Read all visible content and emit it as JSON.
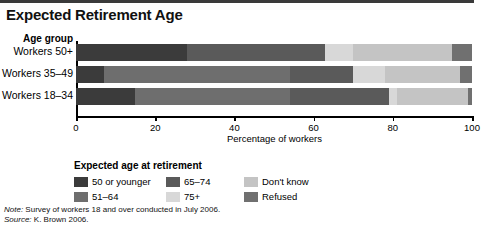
{
  "title": "Expected Retirement Age",
  "axis": {
    "category_axis_title": "Age group",
    "x_title": "Percentage of workers",
    "ticks": [
      0,
      20,
      40,
      60,
      80,
      100
    ]
  },
  "legend": {
    "title": "Expected age at retirement",
    "items": [
      {
        "label": "50 or younger",
        "color": "#3b3b3b"
      },
      {
        "label": "51–64",
        "color": "#6e6e6e"
      },
      {
        "label": "65–74",
        "color": "#5a5a5a"
      },
      {
        "label": "75+",
        "color": "#d8d8d8"
      },
      {
        "label": "Don't know",
        "color": "#c4c4c4"
      },
      {
        "label": "Refused",
        "color": "#707070"
      }
    ]
  },
  "notes": {
    "note_label": "Note:",
    "note_text": " Survey of workers 18 and over conducted in July 2006.",
    "source_label": "Source:",
    "source_text": " K. Brown 2006."
  },
  "chart_data": {
    "type": "bar",
    "orientation": "horizontal",
    "stacked": true,
    "stack_total": 100,
    "title": "Expected Retirement Age",
    "xlabel": "Percentage of workers",
    "ylabel": "Age group",
    "xlim": [
      0,
      100
    ],
    "xticks": [
      0,
      20,
      40,
      60,
      80,
      100
    ],
    "grid": false,
    "legend_position": "bottom-left",
    "categories": [
      "Workers 50+",
      "Workers 35–49",
      "Workers 18–34"
    ],
    "series": [
      {
        "name": "50 or younger",
        "color": "#3b3b3b",
        "values": [
          28,
          7,
          15
        ]
      },
      {
        "name": "51–64",
        "color": "#6e6e6e",
        "values": [
          0,
          47,
          39
        ]
      },
      {
        "name": "65–74",
        "color": "#5a5a5a",
        "values": [
          35,
          16,
          25
        ]
      },
      {
        "name": "75+",
        "color": "#d8d8d8",
        "values": [
          7,
          8,
          2
        ]
      },
      {
        "name": "Don't know",
        "color": "#c4c4c4",
        "values": [
          25,
          19,
          18
        ]
      },
      {
        "name": "Refused",
        "color": "#707070",
        "values": [
          5,
          3,
          1
        ]
      }
    ],
    "bars": [
      {
        "category": "Workers 50+",
        "segments": [
          {
            "name": "50 or younger",
            "value": 28,
            "color": "#3b3b3b"
          },
          {
            "name": "65–74",
            "value": 35,
            "color": "#5a5a5a"
          },
          {
            "name": "75+",
            "value": 7,
            "color": "#d8d8d8"
          },
          {
            "name": "Don't know",
            "value": 25,
            "color": "#c4c4c4"
          },
          {
            "name": "Refused",
            "value": 5,
            "color": "#707070"
          }
        ]
      },
      {
        "category": "Workers 35–49",
        "segments": [
          {
            "name": "50 or younger",
            "value": 7,
            "color": "#3b3b3b"
          },
          {
            "name": "51–64",
            "value": 47,
            "color": "#6e6e6e"
          },
          {
            "name": "65–74",
            "value": 16,
            "color": "#5a5a5a"
          },
          {
            "name": "75+",
            "value": 8,
            "color": "#d8d8d8"
          },
          {
            "name": "Don't know",
            "value": 19,
            "color": "#c4c4c4"
          },
          {
            "name": "Refused",
            "value": 3,
            "color": "#707070"
          }
        ]
      },
      {
        "category": "Workers 18–34",
        "segments": [
          {
            "name": "50 or younger",
            "value": 15,
            "color": "#3b3b3b"
          },
          {
            "name": "51–64",
            "value": 39,
            "color": "#6e6e6e"
          },
          {
            "name": "65–74",
            "value": 25,
            "color": "#5a5a5a"
          },
          {
            "name": "75+",
            "value": 2,
            "color": "#d8d8d8"
          },
          {
            "name": "Don't know",
            "value": 18,
            "color": "#c4c4c4"
          },
          {
            "name": "Refused",
            "value": 1,
            "color": "#707070"
          }
        ]
      }
    ]
  }
}
